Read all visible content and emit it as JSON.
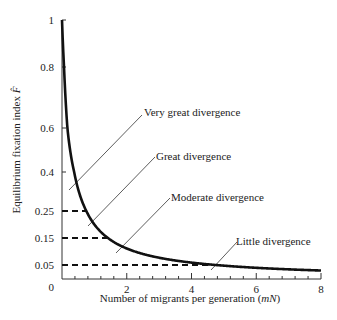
{
  "chart_data": {
    "type": "line",
    "title": "",
    "xlabel": "Number of migrants per generation (mN)",
    "xlabel_parts": {
      "prefix": "Number of migrants per generation (",
      "italic": "mN",
      "suffix": ")"
    },
    "ylabel": "Equilibrium fixation index F̂",
    "ylabel_parts": {
      "text": "Equilibrium fixation index ",
      "symbol": "F̂"
    },
    "xlim": [
      0,
      8
    ],
    "ylim": [
      0,
      1
    ],
    "grid": false,
    "legend": null,
    "x_ticks": [
      "0",
      "2",
      "4",
      "6",
      "8"
    ],
    "x_tick_values": [
      0,
      2,
      4,
      6,
      8
    ],
    "x_minor_step": 0.4,
    "y_ticks": [
      "0",
      "0.05",
      "0.15",
      "0.25",
      "0.4",
      "0.6",
      "0.8",
      "1"
    ],
    "y_tick_values": [
      0,
      0.05,
      0.15,
      0.25,
      0.4,
      0.6,
      0.8,
      1
    ],
    "series": [
      {
        "name": "F = 1/(4mN + 1)",
        "style": "solid-thick",
        "x": [
          0,
          0.1,
          0.25,
          0.5,
          0.75,
          1,
          1.5,
          2,
          2.5,
          3,
          4,
          4.75,
          5,
          6,
          7,
          8
        ],
        "y": [
          1,
          0.714,
          0.5,
          0.333,
          0.25,
          0.2,
          0.143,
          0.111,
          0.091,
          0.077,
          0.059,
          0.05,
          0.048,
          0.04,
          0.034,
          0.03
        ]
      }
    ],
    "reference_lines": [
      {
        "y": 0.25,
        "x_end": 0.75,
        "style": "dashed"
      },
      {
        "y": 0.15,
        "x_end": 1.42,
        "style": "dashed"
      },
      {
        "y": 0.05,
        "x_end": 4.75,
        "style": "dashed"
      }
    ],
    "annotations": [
      {
        "text": "Very great divergence",
        "points_to_region": "F > 0.25"
      },
      {
        "text": "Great divergence",
        "points_to_region": "0.15 < F < 0.25"
      },
      {
        "text": "Moderate divergence",
        "points_to_region": "0.05 < F < 0.15"
      },
      {
        "text": "Little divergence",
        "points_to_region": "F < 0.05"
      }
    ]
  }
}
